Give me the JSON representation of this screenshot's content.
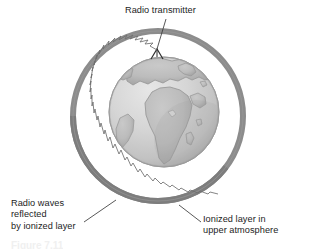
{
  "figure": {
    "kind": "illustration-diagram",
    "background_color": "#ffffff"
  },
  "labels": {
    "transmitter": {
      "text": "Radio transmitter",
      "position": "top-center"
    },
    "reflected_waves": {
      "line1": "Radio waves",
      "line2": "reflected",
      "line3": "by ionized layer",
      "text": "Radio waves\nreflected\nby ionized layer",
      "position": "bottom-left"
    },
    "ionized_layer": {
      "line1": "Ionized layer in",
      "line2": "upper atmosphere",
      "text": "Ionized layer in\nupper atmosphere",
      "position": "bottom-right"
    }
  },
  "caption": {
    "text": "Figure 7.11"
  },
  "colors": {
    "text": "#1d1d1d",
    "leader_line": "#3a3a3a",
    "ionized_ring": "#8c8c8c",
    "ionized_ring_shadow": "#7a7a7a",
    "globe_ocean": "#d6d6d6",
    "globe_land": "#bcbcbc",
    "globe_outline": "#9a9a9a",
    "wave_path": "#6e6e6e",
    "antenna": "#2b2b2b",
    "caption_faded": "#f0f0f0"
  },
  "geometry": {
    "ring": {
      "center_x": 158,
      "center_y": 116,
      "radius": 88,
      "band_thickness": 6
    },
    "globe": {
      "center_x": 164,
      "center_y": 112,
      "radius": 55
    },
    "antenna": {
      "apex_x": 157,
      "apex_y": 50
    }
  },
  "elements": {
    "ring_name": "ionized-layer-ring",
    "globe_name": "earth-globe",
    "antenna_name": "transmitter-antenna-icon",
    "wave_name": "radio-wave-zigzag-path"
  }
}
